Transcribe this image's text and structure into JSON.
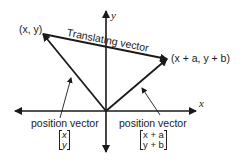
{
  "diagram": {
    "axes": {
      "x_label": "x",
      "y_label": "y"
    },
    "points": {
      "start": "(x, y)",
      "end": "(x + a, y + b)"
    },
    "translating_vector_label": "Translating vector",
    "left_vector": {
      "caption": "position vector",
      "matrix": [
        "x",
        "y"
      ]
    },
    "right_vector": {
      "caption": "position vector",
      "matrix": [
        "x + a",
        "y + b"
      ]
    },
    "colors": {
      "ink": "#1a1a1a",
      "background": "#ffffff"
    }
  }
}
